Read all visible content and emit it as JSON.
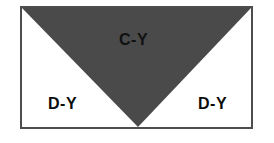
{
  "diagram": {
    "title": "",
    "frame": {
      "border_color": "#4d4d4d",
      "background_color": "#ffffff"
    },
    "regions": [
      {
        "id": "c-y",
        "label": "C-Y",
        "shape": "downward-triangle",
        "fill_color": "#4a4a4a",
        "text_color": "#111111",
        "vertices": "top-left, top-right, bottom-center"
      },
      {
        "id": "d-y-left",
        "label": "D-Y",
        "shape": "corner-triangle-left",
        "fill_color": "#ffffff",
        "text_color": "#0b0b0b"
      },
      {
        "id": "d-y-right",
        "label": "D-Y",
        "shape": "corner-triangle-right",
        "fill_color": "#ffffff",
        "text_color": "#0b0b0b"
      }
    ]
  }
}
